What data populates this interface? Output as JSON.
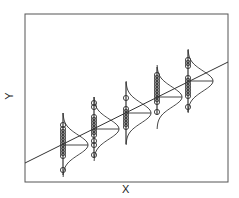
{
  "chart_data": {
    "type": "scatter",
    "title": "",
    "xlabel": "X",
    "ylabel": "Y",
    "grid": false,
    "legend": null,
    "annotations": [
      "Regression line with normal-distribution curves at each X group illustrating conditional distributions of Y"
    ],
    "frame": {
      "left": 25,
      "top": 14,
      "right": 228,
      "bottom": 182
    },
    "regression_line": {
      "x1": 25,
      "y1": 163,
      "x2": 228,
      "y2": 62
    },
    "groups": [
      {
        "x": 63,
        "whisker": [
          113,
          175
        ],
        "mean": 145,
        "points": [
          125,
          129,
          132,
          135,
          138,
          141,
          144,
          147,
          150,
          153,
          156,
          170
        ]
      },
      {
        "x": 94,
        "whisker": [
          97,
          158
        ],
        "mean": 129,
        "points": [
          103,
          107,
          117,
          120,
          123,
          126,
          129,
          132,
          135,
          141,
          145,
          155
        ]
      },
      {
        "x": 126,
        "whisker": [
          82,
          144
        ],
        "mean": 113,
        "points": [
          98,
          109,
          112,
          115,
          118,
          121,
          124,
          127
        ]
      },
      {
        "x": 157,
        "whisker": [
          67,
          115
        ],
        "mean": 97,
        "points": [
          75,
          78,
          81,
          84,
          87,
          90,
          93,
          96,
          99,
          102,
          112
        ]
      },
      {
        "x": 188,
        "whisker": [
          50,
          112
        ],
        "mean": 81,
        "points": [
          60,
          63,
          66,
          78,
          81,
          84,
          87,
          90,
          93,
          96,
          107
        ]
      }
    ],
    "curve": {
      "sigma": 10,
      "peak_width": 25
    }
  },
  "colors": {
    "line": "#333333",
    "frame": "#555555",
    "point": "#333333"
  }
}
